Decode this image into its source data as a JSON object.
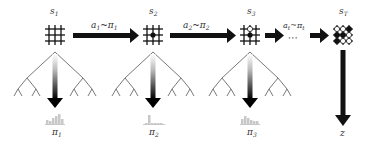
{
  "diagram": {
    "states": [
      {
        "id": "s1",
        "label": "s",
        "sub": "1",
        "stones": []
      },
      {
        "id": "s2",
        "label": "s",
        "sub": "2",
        "stones": [
          {
            "r": 1,
            "c": 1,
            "color": "black"
          }
        ]
      },
      {
        "id": "s3",
        "label": "s",
        "sub": "3",
        "stones": [
          {
            "r": 0,
            "c": 1,
            "color": "white"
          },
          {
            "r": 1,
            "c": 1,
            "color": "black"
          }
        ]
      },
      {
        "id": "sT",
        "label": "s",
        "sub": "T",
        "stones": "full-board"
      }
    ],
    "transitions": [
      {
        "from": "s1",
        "to": "s2",
        "label": "a",
        "sub": "1",
        "dist": "π",
        "dist_sub": "1"
      },
      {
        "from": "s2",
        "to": "s3",
        "label": "a",
        "sub": "2",
        "dist": "π",
        "dist_sub": "2"
      },
      {
        "from": "s3",
        "to": "ellipsis",
        "label": "a",
        "sub": "t",
        "dist": "π",
        "dist_sub": "t"
      },
      {
        "from": "ellipsis",
        "to": "sT",
        "label": "",
        "sub": ""
      }
    ],
    "ellipsis": "⋯",
    "tilde": "~",
    "policies": [
      {
        "label": "π",
        "sub": "1",
        "bars": [
          4,
          3,
          6,
          8,
          10,
          5
        ]
      },
      {
        "label": "π",
        "sub": "2",
        "bars": [
          1,
          9,
          1,
          1,
          1,
          1
        ]
      },
      {
        "label": "π",
        "sub": "3",
        "bars": [
          5,
          8,
          6,
          4,
          3,
          3
        ]
      }
    ],
    "outcome": {
      "label": "z"
    },
    "colors": {
      "ink": "#111111",
      "tree": "#555555",
      "hist": "#c8c8c8",
      "text": "#333333"
    }
  }
}
